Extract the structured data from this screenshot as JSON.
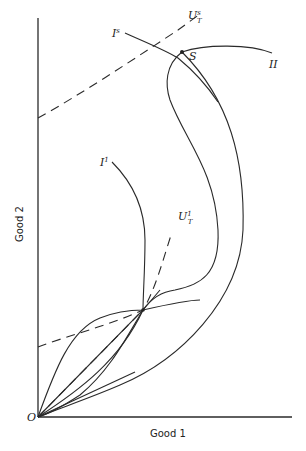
{
  "figure": {
    "x_axis_label": "Good 1",
    "y_axis_label": "Good 2",
    "origin_label": "O",
    "point_S_label": "S",
    "labels": {
      "I_s": {
        "main": "I",
        "sup": "s"
      },
      "I_1": {
        "main": "I",
        "sup": "1"
      },
      "II": "II",
      "U_T_s": {
        "main": "U",
        "sup": "s",
        "sub": "T"
      },
      "U_T_1": {
        "main": "U",
        "sup": "1",
        "sub": "T"
      }
    },
    "curves": [
      {
        "name": "indifference-curve-Is",
        "style": "solid",
        "desc": "Trade indifference curve through S"
      },
      {
        "name": "indifference-curve-I1",
        "style": "solid",
        "desc": "Trade indifference curve through lower tangency"
      },
      {
        "name": "offer-curve-II",
        "style": "solid",
        "desc": "Offer curve from origin through S to II"
      },
      {
        "name": "offer-curve-inner",
        "style": "solid",
        "desc": "Inner offer curve from origin looping to S"
      },
      {
        "name": "utility-line-UTs",
        "style": "dashed"
      },
      {
        "name": "utility-line-UT1",
        "style": "dashed"
      },
      {
        "name": "ray-from-origin",
        "style": "solid"
      }
    ]
  }
}
